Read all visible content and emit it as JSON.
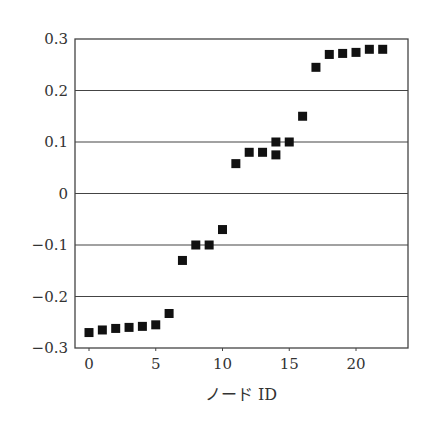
{
  "chart_data": {
    "type": "scatter",
    "title": "",
    "xlabel": "ノード ID",
    "ylabel": "",
    "xlim": [
      -1,
      24
    ],
    "ylim": [
      -0.3,
      0.3
    ],
    "grid": "horizontal",
    "legend": null,
    "marker": "square",
    "marker_color": "#111111",
    "xticks": [
      0,
      5,
      10,
      15,
      20
    ],
    "xtick_labels": [
      "0",
      "5",
      "10",
      "15",
      "20"
    ],
    "yticks": [
      -0.3,
      -0.2,
      -0.1,
      0,
      0.1,
      0.2,
      0.3
    ],
    "ytick_labels": [
      "−0.3",
      "−0.2",
      "−0.1",
      "0",
      "0.1",
      "0.2",
      "0.3"
    ],
    "points": [
      {
        "x": 0,
        "y": -0.27
      },
      {
        "x": 1,
        "y": -0.265
      },
      {
        "x": 2,
        "y": -0.262
      },
      {
        "x": 3,
        "y": -0.26
      },
      {
        "x": 4,
        "y": -0.258
      },
      {
        "x": 5,
        "y": -0.255
      },
      {
        "x": 6,
        "y": -0.233
      },
      {
        "x": 7,
        "y": -0.13
      },
      {
        "x": 8,
        "y": -0.1
      },
      {
        "x": 9,
        "y": -0.1
      },
      {
        "x": 10,
        "y": -0.07
      },
      {
        "x": 11,
        "y": 0.058
      },
      {
        "x": 12,
        "y": 0.08
      },
      {
        "x": 13,
        "y": 0.08
      },
      {
        "x": 14,
        "y": 0.1
      },
      {
        "x": 14,
        "y": 0.075
      },
      {
        "x": 15,
        "y": 0.1
      },
      {
        "x": 16,
        "y": 0.15
      },
      {
        "x": 17,
        "y": 0.245
      },
      {
        "x": 18,
        "y": 0.27
      },
      {
        "x": 19,
        "y": 0.272
      },
      {
        "x": 20,
        "y": 0.274
      },
      {
        "x": 21,
        "y": 0.28
      },
      {
        "x": 22,
        "y": 0.28
      }
    ]
  },
  "axes": {
    "x_title": "ノード ID"
  }
}
